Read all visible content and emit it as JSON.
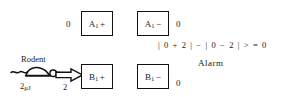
{
  "diagram": {
    "title_hidden": "",
    "units": [
      {
        "id": "a1-plus",
        "label_base": "A",
        "label_sub": "1",
        "label_sign": "+",
        "input_value": "0",
        "value_side": "left"
      },
      {
        "id": "a1-minus",
        "label_base": "A",
        "label_sub": "1",
        "label_sign": "−",
        "input_value": "0",
        "value_side": "right"
      },
      {
        "id": "b1-plus",
        "label_base": "B",
        "label_sub": "1",
        "label_sign": "+",
        "input_value": "2",
        "value_side": "left"
      },
      {
        "id": "b1-minus",
        "label_base": "B",
        "label_sub": "1",
        "label_sign": "−",
        "input_value": "0",
        "value_side": "right"
      }
    ],
    "stimulus": {
      "source_label": "Rodent",
      "energy_label_value": "2",
      "energy_label_mu": "μ",
      "energy_label_unit": "J",
      "arrow_value": "2",
      "icon": "rodent-icon"
    },
    "computation": {
      "equation": "| 0 + 2 |  −  | 0 − 2 | > = 0",
      "result_label": "Alarm"
    },
    "colors": {
      "ink": "#111111",
      "background": "#ffffff"
    }
  }
}
